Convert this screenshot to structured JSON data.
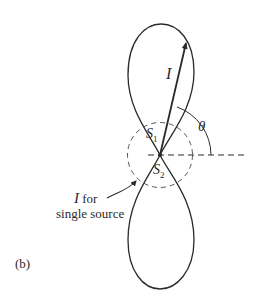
{
  "figure": {
    "panel_label": "(b)",
    "labels": {
      "intensity": "I",
      "theta": "θ",
      "source1": "S",
      "source1_sub": "1",
      "source2": "S",
      "source2_sub": "2",
      "single_source_line1_italic": "I",
      "single_source_line1_rest": " for",
      "single_source_line2": "single source"
    },
    "colors": {
      "stroke": "#2a2a2a",
      "background": "#ffffff"
    }
  }
}
